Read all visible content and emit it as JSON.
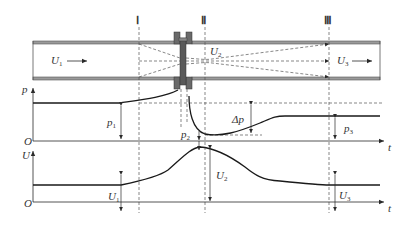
{
  "diagram": {
    "sections": [
      {
        "id": "I",
        "label": "Ⅰ"
      },
      {
        "id": "II",
        "label": "Ⅱ"
      },
      {
        "id": "III",
        "label": "Ⅲ"
      }
    ],
    "pipe_labels": {
      "u1": {
        "main": "U",
        "sub": "1"
      },
      "u2": {
        "main": "U",
        "sub": "2"
      },
      "u3": {
        "main": "U",
        "sub": "3"
      }
    },
    "pressure_chart": {
      "y_axis": "p",
      "x_axis": "t",
      "origin": "O",
      "p1": {
        "main": "p",
        "sub": "1"
      },
      "p2": {
        "main": "p",
        "sub": "2"
      },
      "p3": {
        "main": "p",
        "sub": "3"
      },
      "delta_p": "Δp"
    },
    "velocity_chart": {
      "y_axis": "U",
      "x_axis": "t",
      "origin": "O",
      "u1": {
        "main": "U",
        "sub": "1"
      },
      "u2": {
        "main": "U",
        "sub": "2"
      },
      "u3": {
        "main": "U",
        "sub": "3"
      }
    },
    "colors": {
      "line": "#2a2a2a",
      "pipe_wall": "#8a8a8a",
      "plate": "#5a5a5a",
      "dashed": "#555555"
    }
  }
}
